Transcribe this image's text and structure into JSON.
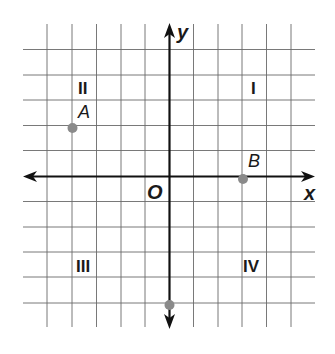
{
  "diagram": {
    "type": "coordinate-plane",
    "grid": {
      "x_min": -5,
      "x_max": 5,
      "y_min": -6,
      "y_max": 5,
      "unit": 1
    },
    "axes": {
      "x_label": "x",
      "y_label": "y",
      "origin_label": "O"
    },
    "quadrants": [
      {
        "id": "I",
        "label": "I"
      },
      {
        "id": "II",
        "label": "II"
      },
      {
        "id": "III",
        "label": "III"
      },
      {
        "id": "IV",
        "label": "IV"
      }
    ],
    "points": [
      {
        "label": "A",
        "x": -4,
        "y": 2
      },
      {
        "label": "B",
        "x": 3,
        "y": 0
      },
      {
        "label": "",
        "x": 0,
        "y": -5
      }
    ],
    "colors": {
      "grid": "#555555",
      "axis": "#111111",
      "point": "#8a8a8a"
    }
  }
}
